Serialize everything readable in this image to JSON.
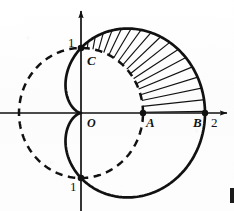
{
  "figure": {
    "background_color": "#fdfdfd",
    "ink_color": "#111111"
  },
  "axes": {
    "origin_label": "O",
    "x_axis_name": "x-axis",
    "y_axis_name": "y-axis",
    "x_tick_labels": [
      "2"
    ],
    "y_tick_labels": [
      "1",
      "1"
    ]
  },
  "labels": {
    "y_top_one": "1",
    "y_bottom_one": "1",
    "point_c": "C",
    "origin": "O",
    "point_a": "A",
    "point_b": "B",
    "x_two": "2"
  },
  "points": [
    {
      "name": "C",
      "label": "C",
      "x": 0,
      "y": 1
    },
    {
      "name": "A",
      "label": "A",
      "x": 1,
      "y": 0
    },
    {
      "name": "B",
      "label": "B",
      "x": 2,
      "y": 0
    },
    {
      "name": "bottom",
      "label": "1",
      "x": 0,
      "y": -1
    }
  ],
  "curves": [
    {
      "name": "cardioid",
      "equation": "r = 1 + cos(theta)",
      "style": "solid",
      "color": "#111111"
    },
    {
      "name": "unit-circle",
      "equation": "r = 1",
      "style": "dashed",
      "color": "#111111"
    }
  ],
  "shaded_region": {
    "name": "hatched-region",
    "hatch_style": "radial-fan-lines",
    "description": "Region between unit circle and cardioid in the first quadrant"
  },
  "chart_data": {
    "type": "line",
    "xlabel": "x",
    "ylabel": "y",
    "xlim": [
      -1.3,
      2.35
    ],
    "ylim": [
      -1.6,
      1.6
    ],
    "grid": false,
    "legend": "none",
    "annotations": [
      "1",
      "C",
      "O",
      "A",
      "B",
      "2",
      "1"
    ],
    "series": [
      {
        "name": "cardioid",
        "equation": "r = 1 + cos(theta)",
        "style": "solid",
        "key_points": [
          {
            "theta_deg": 0,
            "r": 2,
            "x": 2,
            "y": 0,
            "label": "B"
          },
          {
            "theta_deg": 90,
            "r": 1,
            "x": 0,
            "y": 1,
            "label": "C"
          },
          {
            "theta_deg": 180,
            "r": 0,
            "x": 0,
            "y": 0,
            "label": "O"
          },
          {
            "theta_deg": 270,
            "r": 1,
            "x": 0,
            "y": -1,
            "label": "1"
          }
        ]
      },
      {
        "name": "unit-circle",
        "equation": "r = 1",
        "style": "dashed",
        "key_points": [
          {
            "theta_deg": 0,
            "r": 1,
            "x": 1,
            "y": 0,
            "label": "A"
          },
          {
            "theta_deg": 90,
            "r": 1,
            "x": 0,
            "y": 1,
            "label": "C"
          },
          {
            "theta_deg": 180,
            "r": 1,
            "x": -1,
            "y": 0,
            "label": ""
          },
          {
            "theta_deg": 270,
            "r": 1,
            "x": 0,
            "y": -1,
            "label": "1"
          }
        ]
      }
    ]
  }
}
